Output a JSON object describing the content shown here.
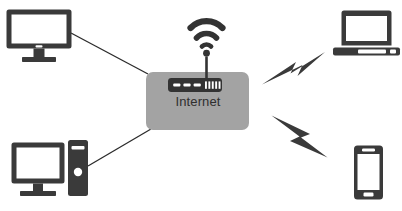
{
  "diagram": {
    "background_color": "#ffffff",
    "hub": {
      "label": "Internet",
      "box_color": "#a3a3a3",
      "label_color": "#2f2f2f",
      "icon_name": "router-icon",
      "icon_color": "#333333",
      "router_led_count": 3,
      "router_port_count": 5
    },
    "wireless": {
      "icon_name": "wifi-signal-icon",
      "color": "#333333",
      "arc_count": 3,
      "has_antenna_line": true
    },
    "nodes": [
      {
        "id": "desktop-monitor",
        "icon_name": "desktop-monitor-icon",
        "label": "",
        "color": "#3a3a3a",
        "position": "top-left",
        "connection": "wired-line"
      },
      {
        "id": "desktop-tower",
        "icon_name": "desktop-computer-tower-icon",
        "label": "",
        "color": "#3a3a3a",
        "position": "bottom-left",
        "connection": "wired-line"
      },
      {
        "id": "laptop",
        "icon_name": "laptop-icon",
        "label": "",
        "color": "#3a3a3a",
        "position": "top-right",
        "connection": "wireless-bolt"
      },
      {
        "id": "smartphone",
        "icon_name": "smartphone-icon",
        "label": "",
        "color": "#3a3a3a",
        "position": "bottom-right",
        "connection": "wireless-bolt"
      }
    ],
    "connections": [
      {
        "id": "link-monitor",
        "type": "wired-line",
        "from": "desktop-monitor",
        "to": "hub",
        "color": "#2b2b2b"
      },
      {
        "id": "link-tower",
        "type": "wired-line",
        "from": "desktop-tower",
        "to": "hub",
        "color": "#2b2b2b"
      },
      {
        "id": "link-laptop",
        "type": "wireless-bolt",
        "from": "hub",
        "to": "laptop",
        "color": "#3a3a3a",
        "icon_name": "lightning-bolt-icon"
      },
      {
        "id": "link-smartphone",
        "type": "wireless-bolt",
        "from": "hub",
        "to": "smartphone",
        "color": "#3a3a3a",
        "icon_name": "lightning-bolt-icon"
      }
    ]
  }
}
